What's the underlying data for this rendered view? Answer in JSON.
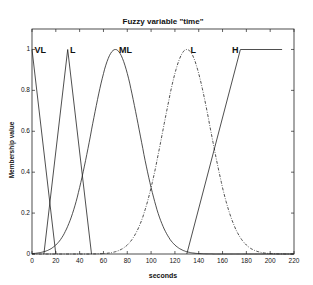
{
  "chart_data": {
    "type": "line",
    "title": "Fuzzy variable \"time\"",
    "xlabel": "seconds",
    "ylabel": "Membership value",
    "xlim": [
      0,
      220
    ],
    "ylim": [
      0,
      1.1
    ],
    "xticks": [
      0,
      20,
      40,
      60,
      80,
      100,
      120,
      140,
      160,
      180,
      200,
      220
    ],
    "yticks": [
      0,
      0.2,
      0.4,
      0.6,
      0.8,
      1
    ],
    "grid": false,
    "series": [
      {
        "name": "VL",
        "shape": "triangular",
        "style": "solid",
        "points": [
          [
            0,
            1
          ],
          [
            20,
            0
          ]
        ]
      },
      {
        "name": "L",
        "shape": "triangular",
        "style": "solid",
        "points": [
          [
            10,
            0
          ],
          [
            30,
            1
          ],
          [
            50,
            0
          ]
        ]
      },
      {
        "name": "ML",
        "shape": "gaussian",
        "style": "solid",
        "center": 70,
        "sigma": 20
      },
      {
        "name": "L",
        "shape": "gaussian",
        "style": "dashdot",
        "center": 130,
        "sigma": 20
      },
      {
        "name": "H",
        "shape": "trapezoidal",
        "style": "solid",
        "points": [
          [
            130,
            0
          ],
          [
            175,
            1
          ],
          [
            210,
            1
          ]
        ]
      }
    ],
    "labels": [
      {
        "text": "VL",
        "x": 2,
        "y": 1
      },
      {
        "text": "L",
        "x": 32,
        "y": 1
      },
      {
        "text": "ML",
        "x": 73,
        "y": 1
      },
      {
        "text": "L",
        "x": 133,
        "y": 1
      },
      {
        "text": "H",
        "x": 168,
        "y": 1
      }
    ]
  }
}
